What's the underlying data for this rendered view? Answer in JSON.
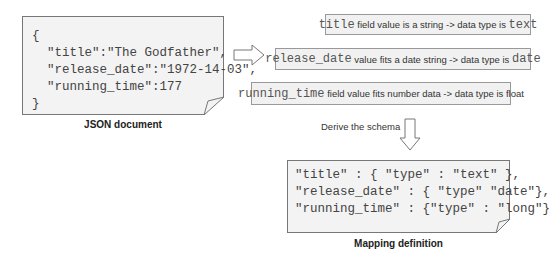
{
  "json_document": {
    "lines": [
      "{",
      "  \"title\":\"The Godfather\",",
      "  \"release_date\":\"1972-14-03\",",
      "  \"running_time\":177",
      "}"
    ],
    "caption": "JSON document"
  },
  "arrow_right": {
    "icon": "arrow-right-icon"
  },
  "inferences": [
    {
      "field": "title",
      "text": " field value is a string -> data type is ",
      "type": "text",
      "type_mono": true
    },
    {
      "field": "release_date",
      "text": " value fits a date string -> data type is ",
      "type": "date",
      "type_mono": true
    },
    {
      "field": "running_time",
      "text": " field value fits number data -> data type is ",
      "type": "float",
      "type_mono": false
    }
  ],
  "derive": {
    "label": "Derive the schema",
    "icon": "arrow-down-icon"
  },
  "mapping_definition": {
    "lines": [
      "\"title\" : { \"type\" : \"text\" },",
      "\"release_date\" : { \"type\" \"date\"},",
      "\"running_time\" : {\"type\" : \"long\"}"
    ],
    "caption": "Mapping definition"
  }
}
